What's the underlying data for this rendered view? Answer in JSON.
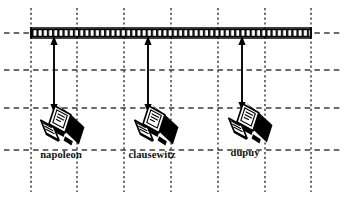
{
  "diagram": {
    "type": "network-topology-diagram",
    "canvas": {
      "width": 347,
      "height": 197,
      "background": "#ffffff"
    },
    "colors": {
      "ink": "#000000",
      "grid": "#3a3a3a",
      "background": "#ffffff",
      "icon_dark": "#000000",
      "icon_light": "#ffffff"
    },
    "bus": {
      "name": "bus-cable",
      "label": "",
      "x1": 31,
      "x2": 311,
      "y": 33,
      "thickness": 7
    },
    "grid": {
      "vertical_lines": [
        31,
        77,
        124,
        171,
        218,
        265,
        311
      ],
      "horizontal_lines": [
        33,
        70,
        108,
        150
      ],
      "vertical_top": 8,
      "vertical_bottom": 192,
      "horizontal_left": 4,
      "horizontal_right": 343
    },
    "nodes": [
      {
        "id": "node-1",
        "label": "napoleon",
        "icon": "desktop-computer-icon",
        "tap_x": 54,
        "icon_cx": 60,
        "icon_cy": 130,
        "label_x": 61,
        "label_y": 158,
        "drop_top": 37,
        "drop_bottom": 112
      },
      {
        "id": "node-2",
        "label": "clausewitz",
        "icon": "desktop-computer-icon",
        "tap_x": 148,
        "icon_cx": 154,
        "icon_cy": 130,
        "label_x": 152,
        "label_y": 158,
        "drop_top": 37,
        "drop_bottom": 112
      },
      {
        "id": "node-3",
        "label": "dupuy",
        "icon": "desktop-computer-icon",
        "tap_x": 242,
        "icon_cx": 248,
        "icon_cy": 128,
        "label_x": 245,
        "label_y": 156,
        "drop_top": 37,
        "drop_bottom": 110
      }
    ],
    "connector": {
      "style": "double-headed-arrow",
      "description": "bidirectional drop cable"
    }
  }
}
